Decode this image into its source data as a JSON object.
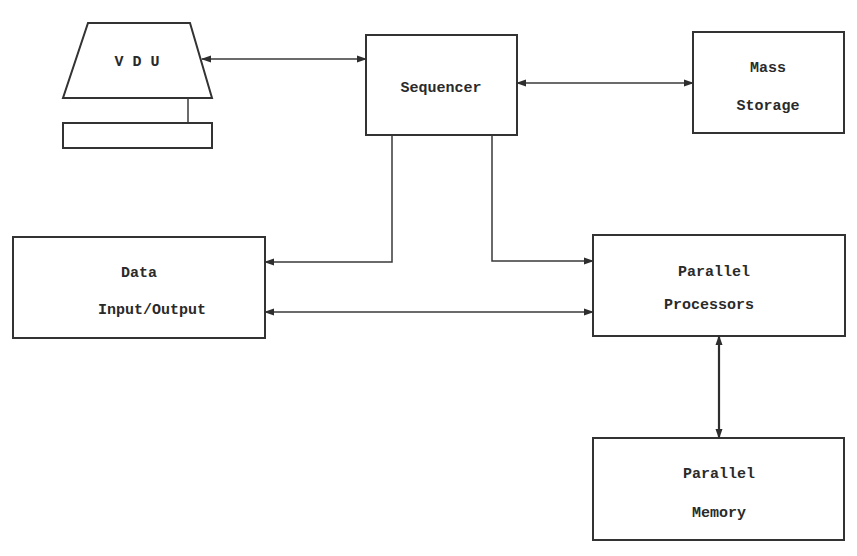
{
  "diagram": {
    "type": "block-diagram",
    "nodes": {
      "vdu": {
        "label": "V D U",
        "shape": "monitor"
      },
      "sequencer": {
        "label": "Sequencer"
      },
      "mass_storage": {
        "line1": "Mass",
        "line2": "Storage"
      },
      "data_io": {
        "line1": "Data",
        "line2": "Input/Output"
      },
      "parallel_processors": {
        "line1": "Parallel",
        "line2": "Processors"
      },
      "parallel_memory": {
        "line1": "Parallel",
        "line2": "Memory"
      }
    },
    "edges": [
      {
        "from": "vdu",
        "to": "sequencer",
        "direction": "bidirectional"
      },
      {
        "from": "sequencer",
        "to": "mass_storage",
        "direction": "bidirectional"
      },
      {
        "from": "sequencer",
        "to": "data_io",
        "direction": "one-way"
      },
      {
        "from": "sequencer",
        "to": "parallel_processors",
        "direction": "one-way"
      },
      {
        "from": "data_io",
        "to": "parallel_processors",
        "direction": "bidirectional"
      },
      {
        "from": "parallel_processors",
        "to": "parallel_memory",
        "direction": "bidirectional"
      }
    ],
    "colors": {
      "stroke": "#333333",
      "text": "#2a2a2a",
      "background": "#ffffff"
    }
  }
}
